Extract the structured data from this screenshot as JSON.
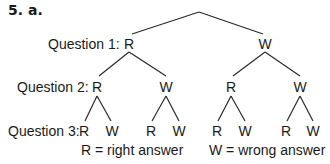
{
  "title": "5. a.",
  "questions": [
    "Question 1:",
    "Question 2:",
    "Question 3:"
  ],
  "tree": {
    "level1": [
      "R",
      "W"
    ],
    "level2": [
      "R",
      "W",
      "R",
      "W"
    ],
    "level3": [
      "R",
      "W",
      "R",
      "W",
      "R",
      "W",
      "R",
      "W"
    ]
  },
  "legend": {
    "right": "R = right answer",
    "wrong": "W = wrong answer"
  },
  "line_color": "#2a2a2a"
}
